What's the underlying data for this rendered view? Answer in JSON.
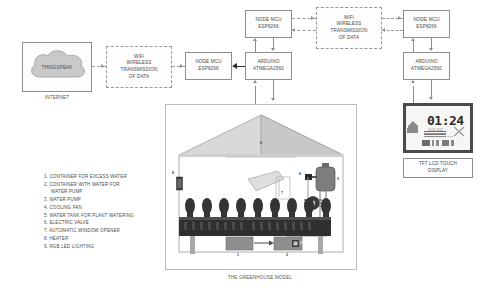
{
  "diagram": {
    "greenhouse_caption": "THE GREENHOUSE MODEL",
    "internet_caption": "INTERNET",
    "tft_caption_line1": "TFT LCD TOUCH",
    "tft_caption_line2": "DISPLAY"
  },
  "nodes": {
    "thingspeak": {
      "label": "THINGSPEAK"
    },
    "wifi_left": {
      "line1": "WiFi",
      "line2": "WIRELESS",
      "line3": "TRANSMISSION",
      "line4": "OF DATA"
    },
    "wifi_right": {
      "line1": "WiFi",
      "line2": "WIRELESS",
      "line3": "TRANSMISSION",
      "line4": "OF DATA"
    },
    "nodemcu_left": {
      "line1": "NODE MCU",
      "line2": "ESP8266"
    },
    "nodemcu_top": {
      "line1": "NODE MCU",
      "line2": "ESP8266"
    },
    "nodemcu_right": {
      "line1": "NODE MCU",
      "line2": "ESP8266"
    },
    "arduino_center": {
      "line1": "ARDUINO",
      "line2": "ATMEGA2560"
    },
    "arduino_right": {
      "line1": "ARDUINO",
      "line2": "ATMEGA2560"
    }
  },
  "tft_screen": {
    "clock": "01:24",
    "date_text": "24.05.2021",
    "status_text": "GREENHOUSE STATUS",
    "icon_row": "▒▒ ▒ ▒▒"
  },
  "legend": {
    "items": [
      {
        "num": "1.",
        "text": "CONTAINER FOR EXCESS WATER"
      },
      {
        "num": "2.",
        "text": "CONTAINER WITH WATER FOR"
      },
      {
        "num": "",
        "text": "WATER PUMP"
      },
      {
        "num": "3.",
        "text": "WATER PUMP"
      },
      {
        "num": "4.",
        "text": "COOLING FAN"
      },
      {
        "num": "5.",
        "text": "WATER TANK FOR PLANT WATERING"
      },
      {
        "num": "6.",
        "text": "ELECTRIC VALVE"
      },
      {
        "num": "7.",
        "text": "AUTOMATIC WINDOW OPENER"
      },
      {
        "num": "8.",
        "text": "HEATER"
      },
      {
        "num": "9.",
        "text": "RGB LED LIGHTING"
      }
    ]
  },
  "callouts": {
    "c1": "1",
    "c2": "2",
    "c3": "3",
    "c4": "4",
    "c5": "5",
    "c6": "6",
    "c7": "7",
    "c8": "8",
    "c9": "9"
  },
  "colors": {
    "line": "#8d8d8d",
    "box_border": "#8e8e8e",
    "text": "#4a4a4a",
    "soil": "#2f2f2f",
    "plant": "#3a3a3a",
    "tank": "#6f6f6f",
    "frame": "#4b4b4b"
  }
}
